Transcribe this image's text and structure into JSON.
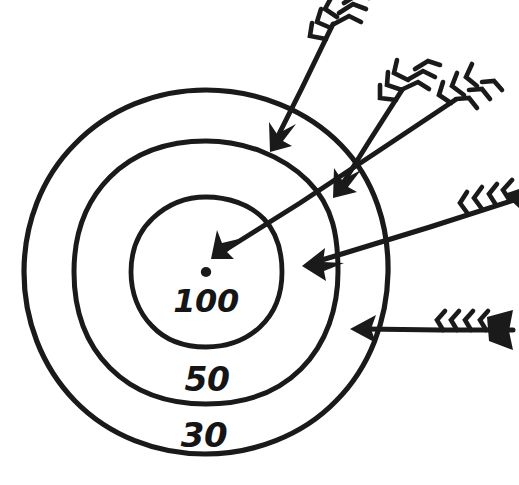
{
  "figure": {
    "background_color": "#ffffff",
    "ink_color": "#1a1a1a",
    "style": "hand-drawn line art"
  },
  "target": {
    "center": {
      "x": 206,
      "y": 272
    },
    "center_dot_radius": 5,
    "rings": [
      {
        "name": "inner-ring",
        "label": "100",
        "score": 100,
        "radius": 76,
        "label_position": {
          "x": 206,
          "y": 310
        }
      },
      {
        "name": "middle-ring",
        "label": "50",
        "score": 50,
        "radius": 132,
        "label_position": {
          "x": 206,
          "y": 389
        }
      },
      {
        "name": "outer-ring",
        "label": "30",
        "score": 30,
        "radius": 182,
        "label_position": {
          "x": 203,
          "y": 445
        }
      }
    ]
  },
  "arrows": [
    {
      "name": "arrow-1",
      "tip": {
        "x": 271,
        "y": 146
      },
      "tail": {
        "x": 333,
        "y": 22
      },
      "lands_in": "outer-ring",
      "score": 30
    },
    {
      "name": "arrow-2",
      "tip": {
        "x": 337,
        "y": 192
      },
      "tail": {
        "x": 402,
        "y": 88
      },
      "lands_in": "middle-ring",
      "score": 50
    },
    {
      "name": "arrow-3",
      "tip": {
        "x": 214,
        "y": 257
      },
      "tail": {
        "x": 455,
        "y": 97
      },
      "lands_in": "inner-ring",
      "score": 100
    },
    {
      "name": "arrow-4",
      "tip": {
        "x": 307,
        "y": 266
      },
      "tail": {
        "x": 512,
        "y": 199
      },
      "lands_in": "middle-ring",
      "score": 50
    },
    {
      "name": "arrow-5",
      "tip": {
        "x": 353,
        "y": 329
      },
      "tail": {
        "x": 513,
        "y": 333
      },
      "lands_in": "outer-ring",
      "score": 30
    }
  ]
}
